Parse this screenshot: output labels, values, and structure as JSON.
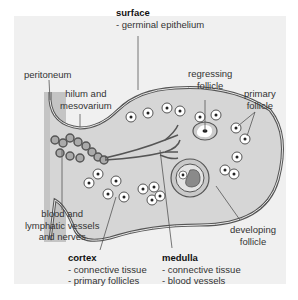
{
  "labels": {
    "surface": {
      "title": "surface",
      "line1": "- germinal epithelium"
    },
    "peritoneum": "peritoneum",
    "hilum": {
      "line1": "hilum and",
      "line2": "mesovarium"
    },
    "regressing": {
      "line1": "regressing",
      "line2": "follicle"
    },
    "primary": {
      "line1": "primary",
      "line2": "follicle"
    },
    "vessels": {
      "line1": "blood and",
      "line2": "lymphatic vessels",
      "line3": "and nerves"
    },
    "developing": {
      "line1": "developing",
      "line2": "follicle"
    },
    "cortex": {
      "title": "cortex",
      "line1": "- connective tissue",
      "line2": "- primary follicles"
    },
    "medulla": {
      "title": "medulla",
      "line1": "- connective tissue",
      "line2": "- blood vessels"
    }
  },
  "colors": {
    "background": "#f0f0f0",
    "ovary_fill": "#d6d6d6",
    "outline": "#555555",
    "mesentery": "#c4c4c4",
    "follicle_dark": "#8a8a8a"
  }
}
